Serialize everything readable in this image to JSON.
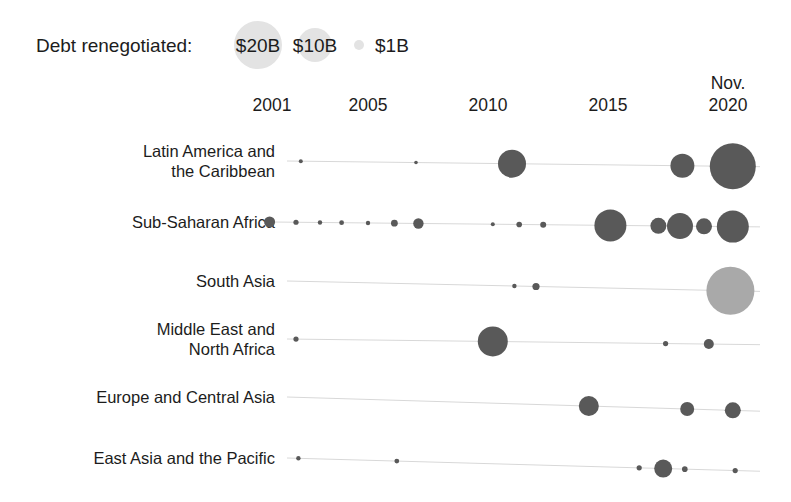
{
  "legend": {
    "title": "Debt renegotiated:",
    "items": [
      {
        "label": "$20B",
        "value": 20,
        "radius": 24
      },
      {
        "label": "$10B",
        "value": 10,
        "radius": 17
      },
      {
        "label": "$1B",
        "value": 1,
        "radius": 5
      }
    ],
    "bubble_color": "#e3e3e3"
  },
  "colors": {
    "bubble_dark": "#595959",
    "bubble_light": "#a9a9a9",
    "gridline": "#d8d8d8",
    "text": "#1c1c1c",
    "background": "#ffffff"
  },
  "chart_data": {
    "type": "scatter",
    "title": "",
    "subtitle": "",
    "xlabel": "",
    "ylabel": "",
    "grid": true,
    "legend_position": "top-left",
    "size_encoding": "Debt renegotiated (US$ billions)",
    "x_ticks": [
      "2001",
      "2005",
      "2010",
      "2015",
      "Nov.\n2020"
    ],
    "x_tick_values": [
      2001,
      2005,
      2010,
      2015,
      2020
    ],
    "x_tick_labels_multiline": [
      [
        "2001"
      ],
      [
        "2005"
      ],
      [
        "2010"
      ],
      [
        "2015"
      ],
      [
        "Nov.",
        "2020"
      ]
    ],
    "xlim": [
      2000.2,
      2021.0
    ],
    "categories": [
      "Latin America and the Caribbean",
      "Sub-Saharan Africa",
      "South Asia",
      "Middle East and North Africa",
      "Europe and Central Asia",
      "East Asia and the Pacific"
    ],
    "category_labels_multiline": [
      [
        "Latin America and",
        "the Caribbean"
      ],
      [
        "Sub-Saharan Africa"
      ],
      [
        "South Asia"
      ],
      [
        "Middle East and",
        "North Africa"
      ],
      [
        "Europe and Central Asia"
      ],
      [
        "East Asia and the Pacific"
      ]
    ],
    "series": [
      {
        "name": "Latin America and the Caribbean",
        "points": [
          {
            "x": 2002.2,
            "value": 0.4,
            "radius": 2.0,
            "shade": "dark"
          },
          {
            "x": 2007.0,
            "value": 0.3,
            "radius": 1.8,
            "shade": "dark"
          },
          {
            "x": 2011.0,
            "value": 7.0,
            "radius": 14.0,
            "shade": "dark"
          },
          {
            "x": 2018.1,
            "value": 5.0,
            "radius": 12.0,
            "shade": "dark"
          },
          {
            "x": 2020.2,
            "value": 18.0,
            "radius": 23.0,
            "shade": "dark"
          }
        ]
      },
      {
        "name": "Sub-Saharan Africa",
        "points": [
          {
            "x": 2000.9,
            "value": 1.2,
            "radius": 5.5,
            "shade": "dark"
          },
          {
            "x": 2002.0,
            "value": 0.3,
            "radius": 2.6,
            "shade": "dark"
          },
          {
            "x": 2003.0,
            "value": 0.2,
            "radius": 2.2,
            "shade": "dark"
          },
          {
            "x": 2003.9,
            "value": 0.2,
            "radius": 2.4,
            "shade": "dark"
          },
          {
            "x": 2005.0,
            "value": 0.2,
            "radius": 2.2,
            "shade": "dark"
          },
          {
            "x": 2006.1,
            "value": 0.5,
            "radius": 3.4,
            "shade": "dark"
          },
          {
            "x": 2007.1,
            "value": 1.1,
            "radius": 5.2,
            "shade": "dark"
          },
          {
            "x": 2010.2,
            "value": 0.2,
            "radius": 2.0,
            "shade": "dark"
          },
          {
            "x": 2011.3,
            "value": 0.4,
            "radius": 2.8,
            "shade": "dark"
          },
          {
            "x": 2012.3,
            "value": 0.4,
            "radius": 3.0,
            "shade": "dark"
          },
          {
            "x": 2015.1,
            "value": 9.0,
            "radius": 16.0,
            "shade": "dark"
          },
          {
            "x": 2017.1,
            "value": 2.2,
            "radius": 8.0,
            "shade": "dark"
          },
          {
            "x": 2018.0,
            "value": 6.0,
            "radius": 13.0,
            "shade": "dark"
          },
          {
            "x": 2019.0,
            "value": 2.2,
            "radius": 8.0,
            "shade": "dark"
          },
          {
            "x": 2020.2,
            "value": 9.0,
            "radius": 16.0,
            "shade": "dark"
          }
        ]
      },
      {
        "name": "South Asia",
        "points": [
          {
            "x": 2011.1,
            "value": 0.2,
            "radius": 2.2,
            "shade": "dark"
          },
          {
            "x": 2012.0,
            "value": 0.5,
            "radius": 3.6,
            "shade": "dark"
          },
          {
            "x": 2020.1,
            "value": 20.0,
            "radius": 24.0,
            "shade": "light"
          }
        ]
      },
      {
        "name": "Middle East and North Africa",
        "points": [
          {
            "x": 2002.0,
            "value": 0.3,
            "radius": 2.6,
            "shade": "dark"
          },
          {
            "x": 2010.2,
            "value": 8.0,
            "radius": 15.0,
            "shade": "dark"
          },
          {
            "x": 2017.4,
            "value": 0.3,
            "radius": 2.6,
            "shade": "dark"
          },
          {
            "x": 2019.2,
            "value": 1.0,
            "radius": 5.0,
            "shade": "dark"
          }
        ]
      },
      {
        "name": "Europe and Central Asia",
        "points": [
          {
            "x": 2014.2,
            "value": 3.5,
            "radius": 10.0,
            "shade": "dark"
          },
          {
            "x": 2018.3,
            "value": 1.8,
            "radius": 7.0,
            "shade": "dark"
          },
          {
            "x": 2020.2,
            "value": 2.2,
            "radius": 8.0,
            "shade": "dark"
          }
        ]
      },
      {
        "name": "East Asia and the Pacific",
        "points": [
          {
            "x": 2002.1,
            "value": 0.2,
            "radius": 2.2,
            "shade": "dark"
          },
          {
            "x": 2006.2,
            "value": 0.2,
            "radius": 2.4,
            "shade": "dark"
          },
          {
            "x": 2016.3,
            "value": 0.3,
            "radius": 2.6,
            "shade": "dark"
          },
          {
            "x": 2017.3,
            "value": 2.6,
            "radius": 9.0,
            "shade": "dark"
          },
          {
            "x": 2018.2,
            "value": 0.3,
            "radius": 2.8,
            "shade": "dark"
          },
          {
            "x": 2020.3,
            "value": 0.3,
            "radius": 2.6,
            "shade": "dark"
          }
        ]
      }
    ]
  }
}
